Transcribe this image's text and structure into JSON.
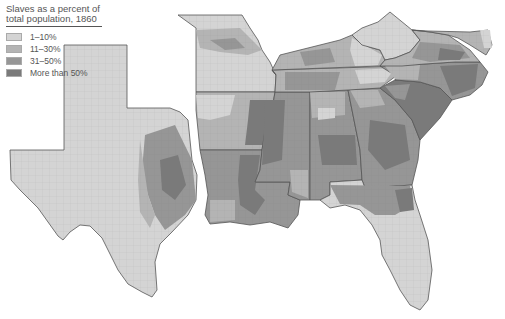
{
  "legend": {
    "title_line1": "Slaves as a percent of",
    "title_line2": "total population, 1860",
    "items": [
      {
        "label": "1–10%",
        "color": "#d4d4d4"
      },
      {
        "label": "11–30%",
        "color": "#b4b4b4"
      },
      {
        "label": "31–50%",
        "color": "#969696"
      },
      {
        "label": "More than 50%",
        "color": "#7a7a7a"
      }
    ]
  },
  "map": {
    "subject": "Slaves as a percent of total population by county, 1860",
    "region": "Southern United States",
    "states": [
      "Texas",
      "Missouri",
      "Arkansas",
      "Louisiana",
      "Mississippi",
      "Alabama",
      "Tennessee",
      "Kentucky",
      "Georgia",
      "Florida",
      "South Carolina",
      "North Carolina",
      "Virginia",
      "West Virginia",
      "Maryland",
      "Delaware"
    ]
  }
}
